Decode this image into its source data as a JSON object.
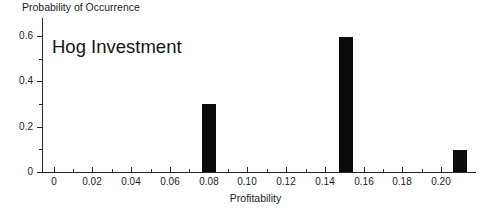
{
  "chart_data": {
    "type": "bar",
    "title": "Hog Investment",
    "xlabel": "Profitability",
    "ylabel": "Probability of Occurrence",
    "grid": false,
    "legend": null,
    "xlim": [
      -0.006,
      0.218
    ],
    "ylim": [
      0,
      0.68
    ],
    "x": [
      0.08,
      0.151,
      0.21
    ],
    "values": [
      0.3,
      0.595,
      0.095
    ],
    "bar_color": "#0b0b0b",
    "bar_width": 0.0073,
    "x_tick_labels": [
      "0",
      "0.02",
      "0.04",
      "0.06",
      "0.08",
      "0.10",
      "0.12",
      "0.14",
      "0.16",
      "0.18",
      "0.20"
    ],
    "x_tick_values": [
      0,
      0.02,
      0.04,
      0.06,
      0.08,
      0.1,
      0.12,
      0.14,
      0.16,
      0.18,
      0.2
    ],
    "x_minor_ticks": [
      0.01,
      0.03,
      0.05,
      0.07,
      0.09,
      0.11,
      0.13,
      0.15,
      0.17,
      0.19,
      0.21
    ],
    "y_tick_labels": [
      "0",
      "0.2",
      "0.4",
      "0.6"
    ],
    "y_tick_values": [
      0,
      0.2,
      0.4,
      0.6
    ],
    "y_minor_ticks": [
      0.1,
      0.3,
      0.5
    ],
    "bars": [
      {
        "label": "0.08",
        "x": 0.08,
        "value": 0.3
      },
      {
        "label": "0.151",
        "x": 0.151,
        "value": 0.595
      },
      {
        "label": "0.21",
        "x": 0.21,
        "value": 0.095
      }
    ]
  }
}
